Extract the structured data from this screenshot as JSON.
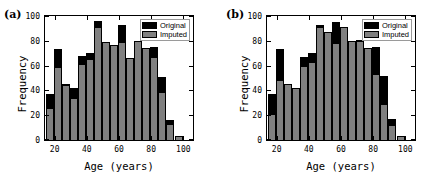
{
  "figure": {
    "background": "#ffffff",
    "panels": [
      {
        "label": "(a)",
        "xlabel": "Age  (years)",
        "ylabel": "Frequency",
        "legend": {
          "items": [
            {
              "label": "Original",
              "color": "#000000"
            },
            {
              "label": "Imputed",
              "color": "#808080"
            }
          ]
        },
        "xticks": [
          "20",
          "40",
          "60",
          "80",
          "100"
        ],
        "yticks": [
          "0",
          "20",
          "40",
          "60",
          "80",
          "100"
        ]
      },
      {
        "label": "(b)",
        "xlabel": "Age  (years)",
        "ylabel": "Frequency",
        "legend": {
          "items": [
            {
              "label": "Original",
              "color": "#000000"
            },
            {
              "label": "Imputed",
              "color": "#808080"
            }
          ]
        },
        "xticks": [
          "20",
          "40",
          "60",
          "80",
          "100"
        ],
        "yticks": [
          "0",
          "20",
          "40",
          "60",
          "80",
          "100"
        ]
      }
    ]
  },
  "chart_data": [
    {
      "type": "bar",
      "title": "(a)",
      "xlabel": "Age  (years)",
      "ylabel": "Frequency",
      "xlim": [
        14,
        106
      ],
      "ylim": [
        0,
        100
      ],
      "bin_width": 5,
      "grid": false,
      "legend_position": "top-right",
      "categories": [
        17,
        22,
        27,
        32,
        37,
        42,
        47,
        52,
        57,
        62,
        67,
        72,
        77,
        82,
        87,
        92,
        97,
        102
      ],
      "series": [
        {
          "name": "Imputed",
          "color": "#808080",
          "values": [
            26,
            59,
            44,
            34,
            61,
            65,
            91,
            79,
            77,
            79,
            66,
            80,
            74,
            67,
            39,
            13,
            3,
            0
          ]
        },
        {
          "name": "Original",
          "color": "#000000",
          "values": [
            37,
            73,
            45,
            42,
            68,
            70,
            96,
            79,
            77,
            93,
            66,
            80,
            74,
            75,
            51,
            16,
            3,
            0
          ]
        }
      ]
    },
    {
      "type": "bar",
      "title": "(b)",
      "xlabel": "Age  (years)",
      "ylabel": "Frequency",
      "xlim": [
        14,
        106
      ],
      "ylim": [
        0,
        100
      ],
      "bin_width": 5,
      "grid": false,
      "legend_position": "top-right",
      "categories": [
        17,
        22,
        27,
        32,
        37,
        42,
        47,
        52,
        57,
        62,
        67,
        72,
        77,
        82,
        87,
        92,
        97,
        102
      ],
      "series": [
        {
          "name": "Imputed",
          "color": "#808080",
          "values": [
            21,
            48,
            45,
            42,
            60,
            63,
            91,
            87,
            78,
            91,
            80,
            80,
            74,
            53,
            29,
            12,
            3,
            0
          ]
        },
        {
          "name": "Original",
          "color": "#000000",
          "values": [
            37,
            73,
            45,
            42,
            67,
            70,
            93,
            87,
            95,
            91,
            80,
            81,
            74,
            75,
            52,
            17,
            3,
            0
          ]
        }
      ]
    }
  ]
}
